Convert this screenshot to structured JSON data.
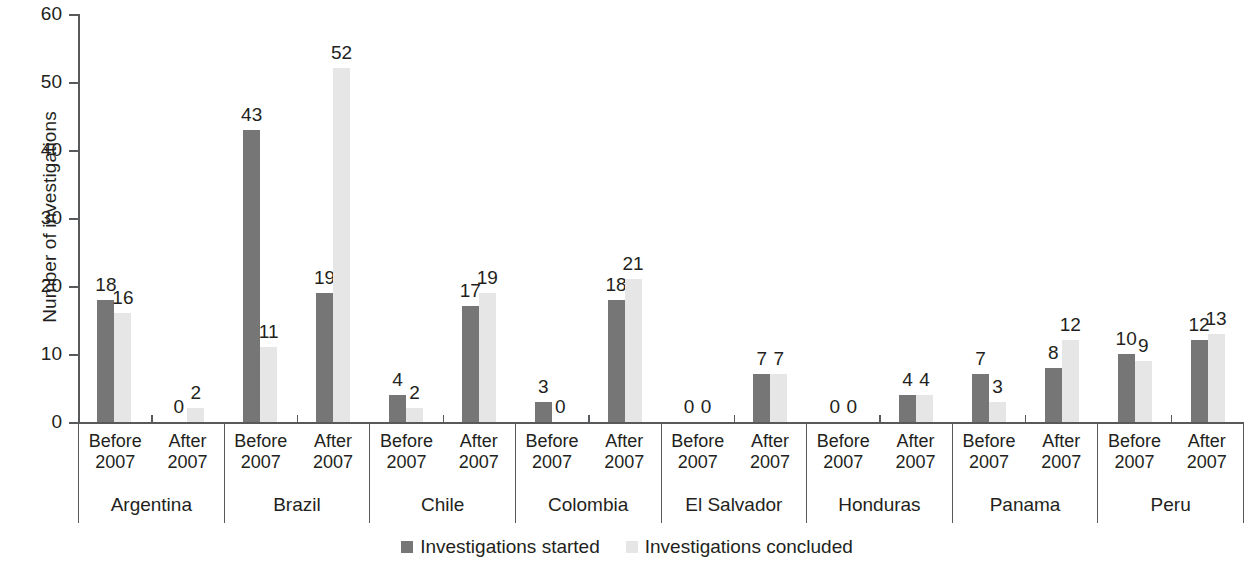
{
  "chart_data": {
    "type": "bar",
    "title": "",
    "xlabel": "",
    "ylabel": "Number of investigations",
    "ylim": [
      0,
      60
    ],
    "yticks": [
      0,
      10,
      20,
      30,
      40,
      50,
      60
    ],
    "grid": false,
    "legend_position": "bottom-center",
    "categories": [
      "Argentina",
      "Brazil",
      "Chile",
      "Colombia",
      "El Salvador",
      "Honduras",
      "Panama",
      "Peru"
    ],
    "subcategories": [
      "Before 2007",
      "After 2007"
    ],
    "series": [
      {
        "name": "Investigations started",
        "color": "#767676",
        "values_before": [
          18,
          43,
          4,
          3,
          0,
          0,
          7,
          10
        ],
        "values_after": [
          0,
          19,
          17,
          18,
          7,
          4,
          8,
          12
        ]
      },
      {
        "name": "Investigations concluded",
        "color": "#e6e6e6",
        "values_before": [
          16,
          11,
          2,
          0,
          0,
          0,
          3,
          9
        ],
        "values_after": [
          2,
          52,
          19,
          21,
          7,
          4,
          12,
          13
        ]
      }
    ],
    "groups": [
      {
        "country": "Argentina",
        "periods": [
          {
            "label_line1": "Before",
            "label_line2": "2007",
            "started": 18,
            "concluded": 16
          },
          {
            "label_line1": "After",
            "label_line2": "2007",
            "started": 0,
            "concluded": 2
          }
        ]
      },
      {
        "country": "Brazil",
        "periods": [
          {
            "label_line1": "Before",
            "label_line2": "2007",
            "started": 43,
            "concluded": 11
          },
          {
            "label_line1": "After",
            "label_line2": "2007",
            "started": 19,
            "concluded": 52
          }
        ]
      },
      {
        "country": "Chile",
        "periods": [
          {
            "label_line1": "Before",
            "label_line2": "2007",
            "started": 4,
            "concluded": 2
          },
          {
            "label_line1": "After",
            "label_line2": "2007",
            "started": 17,
            "concluded": 19
          }
        ]
      },
      {
        "country": "Colombia",
        "periods": [
          {
            "label_line1": "Before",
            "label_line2": "2007",
            "started": 3,
            "concluded": 0
          },
          {
            "label_line1": "After",
            "label_line2": "2007",
            "started": 18,
            "concluded": 21
          }
        ]
      },
      {
        "country": "El Salvador",
        "periods": [
          {
            "label_line1": "Before",
            "label_line2": "2007",
            "started": 0,
            "concluded": 0
          },
          {
            "label_line1": "After",
            "label_line2": "2007",
            "started": 7,
            "concluded": 7
          }
        ]
      },
      {
        "country": "Honduras",
        "periods": [
          {
            "label_line1": "Before",
            "label_line2": "2007",
            "started": 0,
            "concluded": 0
          },
          {
            "label_line1": "After",
            "label_line2": "2007",
            "started": 4,
            "concluded": 4
          }
        ]
      },
      {
        "country": "Panama",
        "periods": [
          {
            "label_line1": "Before",
            "label_line2": "2007",
            "started": 7,
            "concluded": 3
          },
          {
            "label_line1": "After",
            "label_line2": "2007",
            "started": 8,
            "concluded": 12
          }
        ]
      },
      {
        "country": "Peru",
        "periods": [
          {
            "label_line1": "Before",
            "label_line2": "2007",
            "started": 10,
            "concluded": 9
          },
          {
            "label_line1": "After",
            "label_line2": "2007",
            "started": 12,
            "concluded": 13
          }
        ]
      }
    ]
  },
  "axis": {
    "y_title": "Number of investigations",
    "y_tick_labels": [
      "0",
      "10",
      "20",
      "30",
      "40",
      "50",
      "60"
    ]
  },
  "legend": {
    "entries": [
      {
        "label": "Investigations started",
        "color": "#767676"
      },
      {
        "label": "Investigations concluded",
        "color": "#e6e6e6"
      }
    ]
  },
  "colors": {
    "series_started": "#767676",
    "series_concluded": "#e6e6e6",
    "axis": "#58595b",
    "text": "#231f20",
    "background": "#ffffff"
  }
}
